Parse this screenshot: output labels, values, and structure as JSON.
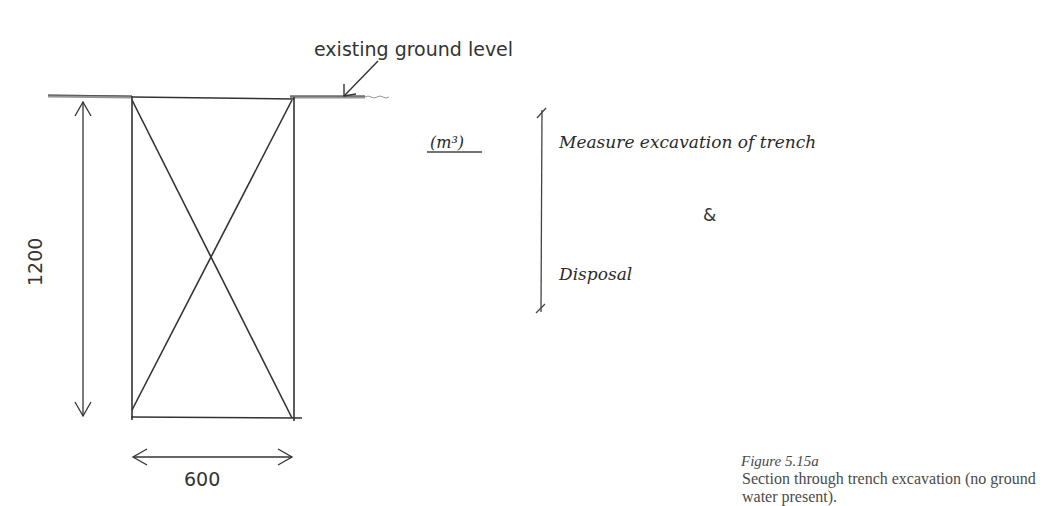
{
  "diagram": {
    "ground_label": "existing ground level",
    "depth_dimension": "1200",
    "width_dimension": "600",
    "unit": "(m³)",
    "measure_text": "Measure excavation of trench",
    "ampersand": "&",
    "disposal_text": "Disposal"
  },
  "caption": {
    "figure_number": "Figure 5.15a",
    "text": "Section through trench excavation (no ground water present)."
  },
  "colors": {
    "line": "#333333",
    "ground": "#777777",
    "caption": "#4a4a4a"
  }
}
